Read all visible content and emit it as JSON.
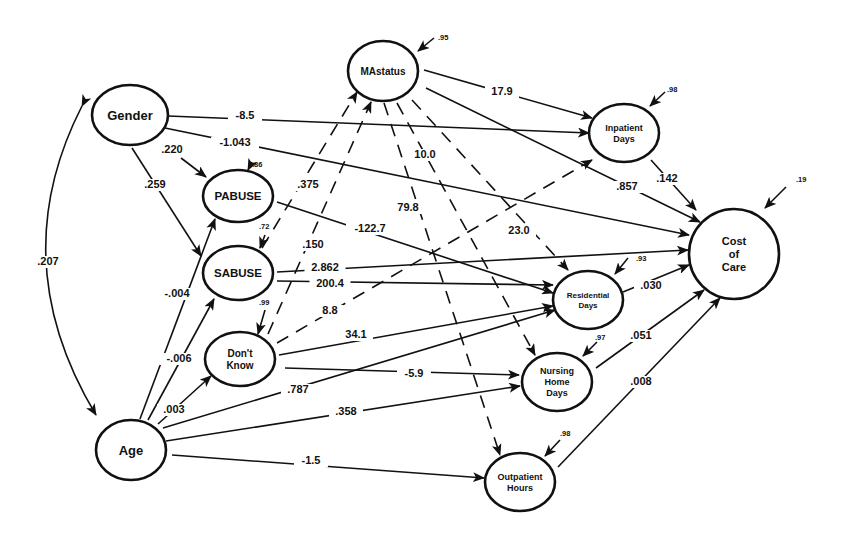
{
  "diagram": {
    "type": "path-diagram",
    "colors": {
      "ink": "#111111",
      "background": "#ffffff"
    },
    "nodes": [
      {
        "id": "gender",
        "label_lines": [
          "Gender"
        ],
        "cx": 130,
        "cy": 115,
        "rx": 38,
        "ry": 30,
        "font": 13
      },
      {
        "id": "age",
        "label_lines": [
          "Age"
        ],
        "cx": 131,
        "cy": 450,
        "rx": 35,
        "ry": 30,
        "font": 13
      },
      {
        "id": "pabuse",
        "label_lines": [
          "PABUSE"
        ],
        "cx": 238,
        "cy": 196,
        "rx": 35,
        "ry": 26,
        "font": 11.5
      },
      {
        "id": "sabuse",
        "label_lines": [
          "SABUSE"
        ],
        "cx": 238,
        "cy": 273,
        "rx": 35,
        "ry": 27,
        "font": 11.5
      },
      {
        "id": "dontknow",
        "label_lines": [
          "Don't",
          "Know"
        ],
        "cx": 240,
        "cy": 359,
        "rx": 35,
        "ry": 27,
        "font": 10
      },
      {
        "id": "mastatus",
        "label_lines": [
          "MAstatus"
        ],
        "cx": 383,
        "cy": 71,
        "rx": 35,
        "ry": 30,
        "font": 10
      },
      {
        "id": "inpatient",
        "label_lines": [
          "Inpatient",
          "Days"
        ],
        "cx": 624,
        "cy": 133,
        "rx": 35,
        "ry": 29,
        "font": 9
      },
      {
        "id": "cost",
        "label_lines": [
          "Cost",
          "of",
          "Care"
        ],
        "cx": 734,
        "cy": 254,
        "rx": 45,
        "ry": 45,
        "font": 11
      },
      {
        "id": "residential",
        "label_lines": [
          "Residential",
          "Days"
        ],
        "cx": 588,
        "cy": 300,
        "rx": 35,
        "ry": 29,
        "font": 8
      },
      {
        "id": "nursing",
        "label_lines": [
          "Nursing",
          "Home",
          "Days"
        ],
        "cx": 557,
        "cy": 382,
        "rx": 35,
        "ry": 29,
        "font": 9
      },
      {
        "id": "outpatient",
        "label_lines": [
          "Outpatient",
          "Hours"
        ],
        "cx": 520,
        "cy": 482,
        "rx": 35,
        "ry": 29,
        "font": 9
      }
    ],
    "edges": [
      {
        "from": "gender",
        "to": "inpatient",
        "label": "-8.5",
        "dashed": false,
        "x1": 168,
        "y1": 116,
        "x2": 589,
        "y2": 133,
        "lx": 245,
        "ly": 119
      },
      {
        "from": "gender",
        "to": "cost",
        "label": "-1.043",
        "dashed": false,
        "x1": 165,
        "y1": 128,
        "x2": 689,
        "y2": 235,
        "lx": 235,
        "ly": 146
      },
      {
        "from": "gender",
        "to": "pabuse",
        "label": ".220",
        "dashed": false,
        "x1": 181,
        "y1": 158,
        "x2": 206,
        "y2": 177,
        "lx": 172,
        "ly": 153
      },
      {
        "from": "gender",
        "to": "sabuse",
        "label": ".259",
        "dashed": false,
        "x1": 132,
        "y1": 148,
        "x2": 201,
        "y2": 256,
        "lx": 155,
        "ly": 188
      },
      {
        "from": "gender",
        "to": "age",
        "label": ".207",
        "dashed": false,
        "curved": true,
        "x1": 82,
        "y1": 106,
        "x2": 96,
        "y2": 415,
        "lx": 48,
        "ly": 265
      },
      {
        "from": "pabuse",
        "to": "residential",
        "label": "-122.7",
        "dashed": false,
        "x1": 277,
        "y1": 202,
        "x2": 553,
        "y2": 293,
        "lx": 370,
        "ly": 232
      },
      {
        "from": "sabuse",
        "to": "cost",
        "label": "2.862",
        "dashed": false,
        "x1": 277,
        "y1": 272,
        "x2": 688,
        "y2": 250,
        "lx": 325,
        "ly": 271
      },
      {
        "from": "sabuse",
        "to": "residential",
        "label": "200.4",
        "dashed": false,
        "x1": 277,
        "y1": 281,
        "x2": 553,
        "y2": 285,
        "lx": 330,
        "ly": 287
      },
      {
        "from": "dontknow",
        "to": "inpatient",
        "label": "8.8",
        "dashed": true,
        "x1": 277,
        "y1": 343,
        "x2": 592,
        "y2": 160,
        "lx": 330,
        "ly": 314
      },
      {
        "from": "dontknow",
        "to": "residential",
        "label": "34.1",
        "dashed": false,
        "x1": 279,
        "y1": 355,
        "x2": 553,
        "y2": 306,
        "lx": 356,
        "ly": 338
      },
      {
        "from": "dontknow",
        "to": "nursing",
        "label": "-5.9",
        "dashed": false,
        "x1": 285,
        "y1": 368,
        "x2": 519,
        "y2": 375,
        "lx": 414,
        "ly": 377
      },
      {
        "from": "dontknow",
        "to": "mastatus",
        "label": ".150",
        "dashed": true,
        "x1": 268,
        "y1": 334,
        "x2": 371,
        "y2": 102,
        "lx": 313,
        "ly": 248
      },
      {
        "from": "sabuse",
        "to": "mastatus",
        "label": ".375",
        "dashed": true,
        "x1": 262,
        "y1": 248,
        "x2": 357,
        "y2": 92,
        "lx": 308,
        "ly": 188
      },
      {
        "from": "age",
        "to": "pabuse",
        "label": "-.004",
        "dashed": false,
        "x1": 140,
        "y1": 419,
        "x2": 215,
        "y2": 219,
        "lx": 177,
        "ly": 297
      },
      {
        "from": "age",
        "to": "sabuse",
        "label": "-.006",
        "dashed": false,
        "x1": 148,
        "y1": 420,
        "x2": 214,
        "y2": 299,
        "lx": 179,
        "ly": 362
      },
      {
        "from": "age",
        "to": "dontknow",
        "label": ".003",
        "dashed": false,
        "x1": 158,
        "y1": 424,
        "x2": 211,
        "y2": 376,
        "lx": 174,
        "ly": 413
      },
      {
        "from": "age",
        "to": "residential",
        "label": ".787",
        "dashed": false,
        "x1": 163,
        "y1": 428,
        "x2": 555,
        "y2": 310,
        "lx": 298,
        "ly": 393
      },
      {
        "from": "age",
        "to": "nursing",
        "label": ".358",
        "dashed": false,
        "x1": 166,
        "y1": 441,
        "x2": 520,
        "y2": 386,
        "lx": 346,
        "ly": 415
      },
      {
        "from": "age",
        "to": "outpatient",
        "label": "-1.5",
        "dashed": false,
        "x1": 172,
        "y1": 455,
        "x2": 484,
        "y2": 478,
        "lx": 311,
        "ly": 464
      },
      {
        "from": "mastatus",
        "to": "inpatient",
        "label": "17.9",
        "dashed": false,
        "x1": 424,
        "y1": 70,
        "x2": 592,
        "y2": 118,
        "lx": 502,
        "ly": 95
      },
      {
        "from": "mastatus",
        "to": "cost",
        "label": ".857",
        "dashed": false,
        "x1": 426,
        "y1": 88,
        "x2": 700,
        "y2": 222,
        "lx": 627,
        "ly": 190
      },
      {
        "from": "mastatus",
        "to": "residential",
        "label": "23.0",
        "dashed": true,
        "x1": 412,
        "y1": 100,
        "x2": 568,
        "y2": 270,
        "lx": 519,
        "ly": 234
      },
      {
        "from": "mastatus",
        "to": "nursing",
        "label": "10.0",
        "dashed": true,
        "x1": 397,
        "y1": 103,
        "x2": 535,
        "y2": 355,
        "lx": 425,
        "ly": 158
      },
      {
        "from": "mastatus",
        "to": "outpatient",
        "label": "79.8",
        "dashed": true,
        "x1": 384,
        "y1": 103,
        "x2": 500,
        "y2": 455,
        "lx": 408,
        "ly": 211
      },
      {
        "from": "inpatient",
        "to": "cost",
        "label": ".142",
        "dashed": false,
        "x1": 651,
        "y1": 160,
        "x2": 696,
        "y2": 210,
        "lx": 667,
        "ly": 182
      },
      {
        "from": "residential",
        "to": "cost",
        "label": ".030",
        "dashed": false,
        "x1": 623,
        "y1": 292,
        "x2": 689,
        "y2": 265,
        "lx": 651,
        "ly": 289
      },
      {
        "from": "nursing",
        "to": "cost",
        "label": ".051",
        "dashed": false,
        "x1": 596,
        "y1": 368,
        "x2": 704,
        "y2": 290,
        "lx": 641,
        "ly": 339
      },
      {
        "from": "outpatient",
        "to": "cost",
        "label": ".008",
        "dashed": false,
        "x1": 558,
        "y1": 467,
        "x2": 720,
        "y2": 298,
        "lx": 641,
        "ly": 385
      }
    ],
    "error_terms": [
      {
        "node": "mastatus",
        "label": ".95",
        "x1": 434,
        "y1": 38,
        "x2": 418,
        "y2": 51,
        "lx": 438,
        "ly": 40
      },
      {
        "node": "inpatient",
        "label": ".98",
        "x1": 665,
        "y1": 92,
        "x2": 650,
        "y2": 106,
        "lx": 667,
        "ly": 92
      },
      {
        "node": "cost",
        "label": ".19",
        "x1": 786,
        "y1": 187,
        "x2": 765,
        "y2": 208,
        "lx": 796,
        "ly": 182
      },
      {
        "node": "pabuse",
        "label": ".86",
        "x1": 252,
        "y1": 162,
        "x2": 248,
        "y2": 170,
        "lx": 252,
        "ly": 167
      },
      {
        "node": "sabuse",
        "label": ".72",
        "x1": 265,
        "y1": 235,
        "x2": 260,
        "y2": 248,
        "lx": 259,
        "ly": 229
      },
      {
        "node": "dontknow",
        "label": ".99",
        "x1": 265,
        "y1": 310,
        "x2": 258,
        "y2": 334,
        "lx": 259,
        "ly": 305
      },
      {
        "node": "residential",
        "label": ".93",
        "x1": 628,
        "y1": 258,
        "x2": 615,
        "y2": 274,
        "lx": 636,
        "ly": 261
      },
      {
        "node": "nursing",
        "label": ".97",
        "x1": 597,
        "y1": 342,
        "x2": 583,
        "y2": 356,
        "lx": 595,
        "ly": 340
      },
      {
        "node": "outpatient",
        "label": ".98",
        "x1": 560,
        "y1": 440,
        "x2": 545,
        "y2": 456,
        "lx": 560,
        "ly": 436
      }
    ]
  }
}
